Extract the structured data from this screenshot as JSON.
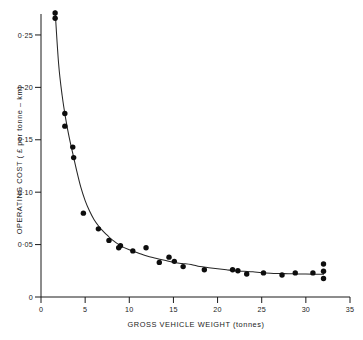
{
  "chart_data": {
    "type": "scatter",
    "title": "",
    "xlabel": "GROSS VEHICLE WEIGHT (tonnes)",
    "ylabel": "OPERATING COST ( £ per tonne – km)",
    "xlim": [
      0,
      35
    ],
    "ylim": [
      0,
      0.27
    ],
    "grid": false,
    "legend": null,
    "xticks": [
      0,
      5,
      10,
      15,
      20,
      25,
      30,
      35
    ],
    "xticklabels": [
      "0",
      "5",
      "10",
      "15",
      "20",
      "25",
      "30",
      "35"
    ],
    "yticks": [
      0,
      0.05,
      0.1,
      0.15,
      0.2,
      0.25
    ],
    "yticklabels": [
      "0",
      "0·05",
      "0·10",
      "0·15",
      "0·20",
      "0·25"
    ],
    "series": [
      {
        "name": "observations",
        "type": "scatter",
        "marker": "filled-circle",
        "color": "#0d0d0d",
        "points": [
          [
            1.6,
            0.271
          ],
          [
            1.6,
            0.266
          ],
          [
            2.7,
            0.175
          ],
          [
            2.7,
            0.163
          ],
          [
            3.6,
            0.143
          ],
          [
            3.7,
            0.133
          ],
          [
            4.8,
            0.08
          ],
          [
            6.5,
            0.065
          ],
          [
            7.7,
            0.054
          ],
          [
            9.0,
            0.049
          ],
          [
            8.8,
            0.047
          ],
          [
            10.4,
            0.044
          ],
          [
            11.9,
            0.047
          ],
          [
            13.4,
            0.033
          ],
          [
            14.5,
            0.038
          ],
          [
            15.1,
            0.034
          ],
          [
            16.1,
            0.029
          ],
          [
            18.5,
            0.026
          ],
          [
            21.7,
            0.026
          ],
          [
            22.3,
            0.025
          ],
          [
            23.3,
            0.022
          ],
          [
            25.2,
            0.023
          ],
          [
            27.3,
            0.021
          ],
          [
            28.8,
            0.023
          ],
          [
            30.8,
            0.023
          ],
          [
            32.0,
            0.0315
          ],
          [
            32.0,
            0.0245
          ],
          [
            32.0,
            0.0177
          ]
        ]
      },
      {
        "name": "fitted-curve",
        "type": "line",
        "color": "#262626",
        "points": [
          [
            1.6,
            0.273
          ],
          [
            2.0,
            0.222
          ],
          [
            2.4,
            0.192
          ],
          [
            2.8,
            0.17
          ],
          [
            3.2,
            0.152
          ],
          [
            3.6,
            0.137
          ],
          [
            4.0,
            0.122
          ],
          [
            4.5,
            0.105
          ],
          [
            5.0,
            0.092
          ],
          [
            5.5,
            0.082
          ],
          [
            6.0,
            0.074
          ],
          [
            6.5,
            0.068
          ],
          [
            7.0,
            0.063
          ],
          [
            7.5,
            0.059
          ],
          [
            8.0,
            0.055
          ],
          [
            9.0,
            0.049
          ],
          [
            10.0,
            0.045
          ],
          [
            11.0,
            0.042
          ],
          [
            12.0,
            0.039
          ],
          [
            13.0,
            0.037
          ],
          [
            14.0,
            0.035
          ],
          [
            15.0,
            0.033
          ],
          [
            16.0,
            0.032
          ],
          [
            17.0,
            0.031
          ],
          [
            18.0,
            0.029
          ],
          [
            19.0,
            0.028
          ],
          [
            20.0,
            0.027
          ],
          [
            21.0,
            0.026
          ],
          [
            22.0,
            0.025
          ],
          [
            23.0,
            0.0245
          ],
          [
            24.0,
            0.024
          ],
          [
            25.0,
            0.0232
          ],
          [
            26.0,
            0.0227
          ],
          [
            27.0,
            0.0224
          ],
          [
            28.0,
            0.0222
          ],
          [
            29.0,
            0.022
          ],
          [
            30.0,
            0.0219
          ],
          [
            31.0,
            0.0218
          ],
          [
            32.0,
            0.0218
          ]
        ]
      }
    ]
  }
}
